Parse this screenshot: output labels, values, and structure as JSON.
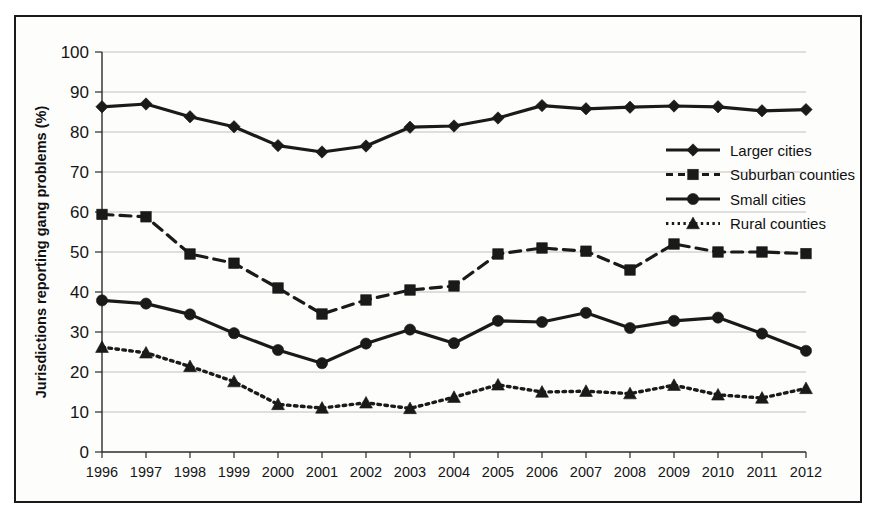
{
  "chart_data": {
    "type": "line",
    "title": "",
    "xlabel": "",
    "ylabel": "Jurisdictions reporting gang problems (%)",
    "x": [
      1996,
      1997,
      1998,
      1999,
      2000,
      2001,
      2002,
      2003,
      2004,
      2005,
      2006,
      2007,
      2008,
      2009,
      2010,
      2011,
      2012
    ],
    "categories": [
      "1996",
      "1997",
      "1998",
      "1999",
      "2000",
      "2001",
      "2002",
      "2003",
      "2004",
      "2005",
      "2006",
      "2007",
      "2008",
      "2009",
      "2010",
      "2011",
      "2012"
    ],
    "ylim": [
      0,
      100
    ],
    "yticks": [
      0,
      10,
      20,
      30,
      40,
      50,
      60,
      70,
      80,
      90,
      100
    ],
    "ytick_labels": [
      "0",
      "10",
      "20",
      "30",
      "40",
      "50",
      "60",
      "70",
      "80",
      "90",
      "100"
    ],
    "grid": true,
    "legend_position": "center-right",
    "series": [
      {
        "name": "Larger cities",
        "marker": "diamond",
        "linestyle": "solid",
        "color": "#1a1a1a",
        "values": [
          86.3,
          87.0,
          83.8,
          81.3,
          76.6,
          75.0,
          76.5,
          81.2,
          81.5,
          83.5,
          86.6,
          85.8,
          86.2,
          86.5,
          86.3,
          85.3,
          85.6
        ]
      },
      {
        "name": "Suburban counties",
        "marker": "square",
        "linestyle": "dashed",
        "color": "#1a1a1a",
        "values": [
          59.4,
          58.8,
          49.5,
          47.2,
          41.0,
          34.5,
          38.0,
          40.5,
          41.5,
          49.5,
          51.0,
          50.2,
          45.5,
          52.0,
          50.0,
          50.0,
          49.6
        ]
      },
      {
        "name": "Small cities",
        "marker": "circle",
        "linestyle": "solid",
        "color": "#1a1a1a",
        "values": [
          37.9,
          37.1,
          34.4,
          29.7,
          25.5,
          22.2,
          27.1,
          30.6,
          27.2,
          32.8,
          32.5,
          34.8,
          31.0,
          32.8,
          33.6,
          29.6,
          25.3
        ]
      },
      {
        "name": "Rural counties",
        "marker": "triangle",
        "linestyle": "dotted",
        "color": "#1a1a1a",
        "values": [
          26.2,
          24.8,
          21.4,
          17.6,
          11.9,
          11.0,
          12.3,
          10.9,
          13.7,
          16.8,
          15.0,
          15.2,
          14.6,
          16.7,
          14.3,
          13.5,
          15.9
        ]
      }
    ]
  },
  "legend": {
    "items": [
      {
        "label": "Larger cities"
      },
      {
        "label": "Suburban counties"
      },
      {
        "label": "Small cities"
      },
      {
        "label": "Rural counties"
      }
    ]
  }
}
